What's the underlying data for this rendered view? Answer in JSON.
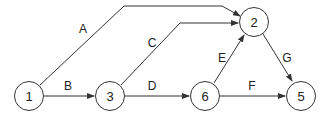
{
  "diagram": {
    "type": "network-graph",
    "colors": {
      "stroke": "#333333",
      "background": "#ffffff",
      "text": "#222222"
    },
    "nodes": [
      {
        "id": "1",
        "label": "1",
        "x": 29,
        "y": 96
      },
      {
        "id": "3",
        "label": "3",
        "x": 110,
        "y": 96
      },
      {
        "id": "6",
        "label": "6",
        "x": 205,
        "y": 96
      },
      {
        "id": "2",
        "label": "2",
        "x": 254,
        "y": 22
      },
      {
        "id": "5",
        "label": "5",
        "x": 301,
        "y": 96
      }
    ],
    "edges": [
      {
        "label": "A",
        "from": "1",
        "to": "2"
      },
      {
        "label": "B",
        "from": "1",
        "to": "3"
      },
      {
        "label": "C",
        "from": "3",
        "to": "2"
      },
      {
        "label": "D",
        "from": "3",
        "to": "6"
      },
      {
        "label": "E",
        "from": "6",
        "to": "2"
      },
      {
        "label": "F",
        "from": "6",
        "to": "5"
      },
      {
        "label": "G",
        "from": "2",
        "to": "5"
      }
    ]
  }
}
